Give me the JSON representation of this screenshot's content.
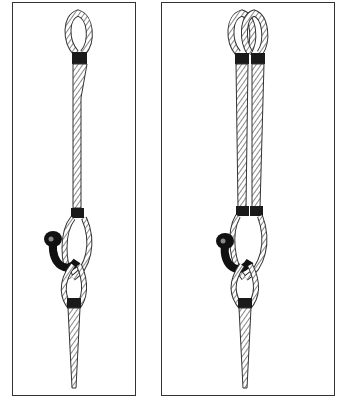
{
  "figure": {
    "panels": [
      {
        "id": "single-leg",
        "label": "Single sling with eye, looped through shackle"
      },
      {
        "id": "double-leg",
        "label": "Double sling with two eyes, looped through shackle"
      }
    ],
    "colors": {
      "rope_hatch": "#555555",
      "ferrule": "#1a1a1a",
      "shackle": "#111111",
      "frame": "#333333"
    }
  }
}
